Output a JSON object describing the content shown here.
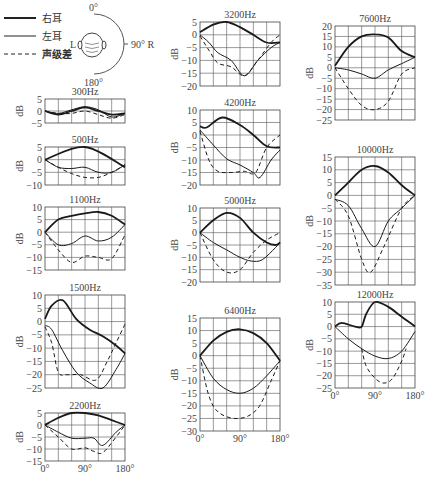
{
  "legend": {
    "items": [
      {
        "label": "右耳",
        "style": "solid-thick"
      },
      {
        "label": "左耳",
        "style": "solid-thin"
      },
      {
        "label": "声级差",
        "style": "dashed"
      }
    ],
    "head_diagram": {
      "top": "0°",
      "bottom": "180°",
      "right": "90° R",
      "left": "L"
    }
  },
  "chart_data": [
    {
      "type": "line",
      "title": "300Hz",
      "ylabel": "dB",
      "xlabel": "",
      "xlim": [
        0,
        180
      ],
      "ylim": [
        -5,
        5
      ],
      "yticks": [
        5,
        0,
        -5
      ],
      "xticks": [],
      "grid": true,
      "series": [
        {
          "name": "右耳",
          "x": [
            0,
            30,
            60,
            90,
            120,
            150,
            180
          ],
          "y": [
            0,
            -1.5,
            0,
            1.5,
            0,
            -1.5,
            -1
          ]
        },
        {
          "name": "左耳",
          "x": [
            0,
            30,
            60,
            90,
            120,
            150,
            180
          ],
          "y": [
            0,
            -1,
            0.5,
            1.8,
            0.5,
            -2.5,
            -1
          ]
        },
        {
          "name": "声级差",
          "x": [
            0,
            30,
            60,
            90,
            120,
            150,
            180
          ],
          "y": [
            0,
            -1,
            -1,
            0,
            -1.5,
            -3,
            -1.5
          ]
        }
      ]
    },
    {
      "type": "line",
      "title": "500Hz",
      "ylabel": "dB",
      "xlabel": "",
      "xlim": [
        0,
        180
      ],
      "ylim": [
        -10,
        5
      ],
      "yticks": [
        5,
        0,
        -5,
        -10
      ],
      "xticks": [],
      "grid": true,
      "series": [
        {
          "name": "右耳",
          "x": [
            0,
            90,
            180
          ],
          "y": [
            0,
            5,
            -3
          ]
        },
        {
          "name": "左耳",
          "x": [
            0,
            30,
            60,
            90,
            120,
            150,
            180
          ],
          "y": [
            0,
            -3,
            -3.5,
            -3,
            -5,
            -5,
            -2
          ]
        },
        {
          "name": "声级差",
          "x": [
            0,
            30,
            60,
            90,
            120,
            150,
            180
          ],
          "y": [
            0,
            -3,
            -5.5,
            -7,
            -7,
            -5,
            -2
          ]
        }
      ]
    },
    {
      "type": "line",
      "title": "1100Hz",
      "ylabel": "dB",
      "xlabel": "",
      "xlim": [
        0,
        180
      ],
      "ylim": [
        -15,
        10
      ],
      "yticks": [
        10,
        5,
        0,
        -5,
        -10,
        -15
      ],
      "xticks": [],
      "grid": true,
      "series": [
        {
          "name": "右耳",
          "x": [
            0,
            30,
            60,
            90,
            120,
            150,
            180
          ],
          "y": [
            0,
            5,
            6.5,
            7.5,
            8,
            6.5,
            3
          ]
        },
        {
          "name": "左耳",
          "x": [
            0,
            30,
            60,
            90,
            120,
            150,
            180
          ],
          "y": [
            0,
            -5,
            -4.5,
            -1.5,
            -3.5,
            -2,
            3
          ]
        },
        {
          "name": "声级差",
          "x": [
            0,
            30,
            60,
            90,
            120,
            150,
            180
          ],
          "y": [
            0,
            -7,
            -12,
            -9.5,
            -10,
            -10.5,
            -1
          ]
        }
      ]
    },
    {
      "type": "line",
      "title": "1500Hz",
      "ylabel": "dB",
      "xlabel": "",
      "xlim": [
        0,
        180
      ],
      "ylim": [
        -25,
        10
      ],
      "yticks": [
        10,
        5,
        0,
        -5,
        -10,
        -15,
        -20,
        -25
      ],
      "xticks": [],
      "grid": true,
      "series": [
        {
          "name": "右耳",
          "x": [
            0,
            15,
            40,
            70,
            100,
            130,
            160,
            180
          ],
          "y": [
            1,
            6,
            8,
            1,
            -3,
            -5.5,
            -9,
            -12
          ]
        },
        {
          "name": "左耳",
          "x": [
            0,
            15,
            40,
            70,
            100,
            130,
            160,
            180
          ],
          "y": [
            -1.5,
            -3,
            -11,
            -19,
            -23,
            -25,
            -18,
            -12
          ]
        },
        {
          "name": "声级差",
          "x": [
            0,
            15,
            30,
            50,
            80,
            115,
            140,
            160,
            180
          ],
          "y": [
            -2,
            -8,
            -19,
            -20,
            -20,
            -22,
            -15,
            -8,
            -1
          ]
        }
      ]
    },
    {
      "type": "line",
      "title": "2200Hz",
      "ylabel": "dB",
      "xlabel": "",
      "xlim": [
        0,
        180
      ],
      "ylim": [
        -15,
        5
      ],
      "yticks": [
        5,
        0,
        -5,
        -10,
        -15
      ],
      "xticks": [
        "0°",
        "90°",
        "180°"
      ],
      "grid": true,
      "series": [
        {
          "name": "右耳",
          "x": [
            0,
            30,
            60,
            90,
            120,
            150,
            180
          ],
          "y": [
            0,
            3,
            5,
            5,
            4,
            2,
            0
          ]
        },
        {
          "name": "左耳",
          "x": [
            0,
            30,
            60,
            90,
            110,
            130,
            160,
            180
          ],
          "y": [
            0,
            -3,
            -5.5,
            -5.5,
            -5.5,
            -8.5,
            -3,
            0
          ]
        },
        {
          "name": "声级差",
          "x": [
            0,
            30,
            60,
            90,
            110,
            130,
            160,
            180
          ],
          "y": [
            0,
            -5,
            -10,
            -9.5,
            -11,
            -11.5,
            -5,
            0
          ]
        }
      ]
    },
    {
      "type": "line",
      "title": "3200Hz",
      "ylabel": "dB",
      "xlabel": "",
      "xlim": [
        0,
        180
      ],
      "ylim": [
        -20,
        5
      ],
      "yticks": [
        5,
        0,
        -5,
        -10,
        -15,
        -20
      ],
      "xticks": [],
      "grid": true,
      "series": [
        {
          "name": "右耳",
          "x": [
            0,
            30,
            60,
            90,
            120,
            150,
            180
          ],
          "y": [
            1,
            4,
            5,
            3,
            0,
            -3,
            -3
          ]
        },
        {
          "name": "左耳",
          "x": [
            0,
            20,
            40,
            70,
            100,
            130,
            160,
            180
          ],
          "y": [
            0,
            -3,
            -7,
            -10,
            -16,
            -10,
            -5,
            -3
          ]
        },
        {
          "name": "声级差",
          "x": [
            0,
            20,
            40,
            70,
            100,
            130,
            160,
            180
          ],
          "y": [
            -0.5,
            -6,
            -11,
            -12.5,
            -16,
            -10,
            -3,
            0
          ]
        }
      ]
    },
    {
      "type": "line",
      "title": "4200Hz",
      "ylabel": "dB",
      "xlabel": "",
      "xlim": [
        0,
        180
      ],
      "ylim": [
        -20,
        10
      ],
      "yticks": [
        10,
        5,
        0,
        -5,
        -10,
        -15,
        -20
      ],
      "xticks": [],
      "grid": true,
      "series": [
        {
          "name": "右耳",
          "x": [
            0,
            15,
            50,
            90,
            120,
            150,
            180
          ],
          "y": [
            3.5,
            3,
            7,
            4,
            0,
            -4.5,
            -5
          ]
        },
        {
          "name": "左耳",
          "x": [
            0,
            30,
            60,
            90,
            120,
            135,
            160,
            180
          ],
          "y": [
            2,
            -4,
            -9.5,
            -12,
            -15,
            -17,
            -10,
            -6
          ]
        },
        {
          "name": "声级差",
          "x": [
            0,
            20,
            40,
            70,
            100,
            125,
            150,
            180
          ],
          "y": [
            1.5,
            -10,
            -14.5,
            -15,
            -14.5,
            -15,
            -5,
            0
          ]
        }
      ]
    },
    {
      "type": "line",
      "title": "5000Hz",
      "ylabel": "dB",
      "xlabel": "",
      "xlim": [
        0,
        180
      ],
      "ylim": [
        -20,
        10
      ],
      "yticks": [
        10,
        5,
        0,
        -5,
        -10,
        -15,
        -20
      ],
      "xticks": [],
      "grid": true,
      "series": [
        {
          "name": "右耳",
          "x": [
            0,
            30,
            60,
            90,
            120,
            150,
            170,
            180
          ],
          "y": [
            0,
            5,
            8,
            6,
            0,
            -4,
            -5,
            -4
          ]
        },
        {
          "name": "左耳",
          "x": [
            0,
            30,
            60,
            90,
            115,
            140,
            170,
            180
          ],
          "y": [
            0,
            -4,
            -7,
            -10,
            -11.5,
            -11,
            -6,
            -4
          ]
        },
        {
          "name": "声级差",
          "x": [
            0,
            30,
            60,
            90,
            120,
            150,
            180
          ],
          "y": [
            0,
            -11,
            -16,
            -15,
            -8,
            -3,
            0
          ]
        }
      ]
    },
    {
      "type": "line",
      "title": "6400Hz",
      "ylabel": "dB",
      "xlabel": "",
      "xlim": [
        0,
        180
      ],
      "ylim": [
        -30,
        15
      ],
      "yticks": [
        15,
        10,
        5,
        0,
        -5,
        -10,
        -15,
        -20,
        -25,
        -30
      ],
      "xticks": [
        "0°",
        "90°",
        "180°"
      ],
      "grid": true,
      "series": [
        {
          "name": "右耳",
          "x": [
            0,
            30,
            60,
            90,
            120,
            150,
            180
          ],
          "y": [
            0,
            6,
            9.5,
            10.5,
            9,
            5,
            -2
          ]
        },
        {
          "name": "左耳",
          "x": [
            0,
            30,
            60,
            90,
            120,
            150,
            180
          ],
          "y": [
            0,
            -9,
            -13.5,
            -15,
            -13,
            -8,
            -2
          ]
        },
        {
          "name": "声级差",
          "x": [
            0,
            20,
            45,
            90,
            130,
            160,
            180
          ],
          "y": [
            0,
            -16,
            -23,
            -25,
            -21,
            -10,
            -2
          ]
        }
      ]
    },
    {
      "type": "line",
      "title": "7600Hz",
      "ylabel": "dB",
      "xlabel": "",
      "xlim": [
        0,
        180
      ],
      "ylim": [
        -25,
        20
      ],
      "yticks": [
        20,
        15,
        10,
        5,
        0,
        -5,
        -10,
        -15,
        -20,
        -25
      ],
      "xticks": [],
      "grid": true,
      "series": [
        {
          "name": "右耳",
          "x": [
            0,
            30,
            60,
            90,
            120,
            150,
            180
          ],
          "y": [
            1,
            10,
            15,
            16,
            14.5,
            8,
            5
          ]
        },
        {
          "name": "左耳",
          "x": [
            0,
            30,
            60,
            90,
            120,
            150,
            180
          ],
          "y": [
            0,
            -1,
            -3,
            -5,
            -1,
            2,
            5
          ]
        },
        {
          "name": "声级差",
          "x": [
            0,
            30,
            60,
            90,
            120,
            150,
            180
          ],
          "y": [
            0,
            -10,
            -18,
            -20,
            -16,
            -3,
            0
          ]
        }
      ]
    },
    {
      "type": "line",
      "title": "10000Hz",
      "ylabel": "dB",
      "xlabel": "",
      "xlim": [
        0,
        180
      ],
      "ylim": [
        -35,
        15
      ],
      "yticks": [
        15,
        10,
        5,
        0,
        -5,
        -10,
        -15,
        -20,
        -25,
        -30,
        -35
      ],
      "xticks": [],
      "grid": true,
      "series": [
        {
          "name": "右耳",
          "x": [
            0,
            30,
            60,
            90,
            120,
            150,
            180
          ],
          "y": [
            0,
            5,
            10,
            11.5,
            9,
            4,
            0
          ]
        },
        {
          "name": "左耳",
          "x": [
            0,
            30,
            60,
            90,
            120,
            150,
            180
          ],
          "y": [
            -1.5,
            -4,
            -13,
            -20,
            -10,
            -5,
            0
          ]
        },
        {
          "name": "声级差",
          "x": [
            0,
            30,
            60,
            80,
            110,
            150,
            180
          ],
          "y": [
            -1.5,
            -8,
            -25,
            -30,
            -20,
            -5,
            0
          ]
        }
      ]
    },
    {
      "type": "line",
      "title": "12000Hz",
      "ylabel": "dB",
      "xlabel": "",
      "xlim": [
        0,
        180
      ],
      "ylim": [
        -25,
        10
      ],
      "yticks": [
        10,
        5,
        0,
        -5,
        -10,
        -15,
        -20,
        -25
      ],
      "xticks": [
        "0°",
        "90°",
        "180°"
      ],
      "grid": true,
      "series": [
        {
          "name": "右耳",
          "x": [
            0,
            15,
            45,
            60,
            70,
            90,
            120,
            150,
            180
          ],
          "y": [
            0,
            1.5,
            0,
            0,
            5,
            10,
            8,
            4,
            0
          ]
        },
        {
          "name": "左耳",
          "x": [
            0,
            30,
            60,
            90,
            120,
            150,
            180
          ],
          "y": [
            0,
            -5,
            -9,
            -12,
            -13,
            -10,
            -2
          ]
        },
        {
          "name": "声级差",
          "x": [
            60,
            70,
            90,
            110,
            130,
            150,
            160
          ],
          "y": [
            -9,
            -16,
            -21,
            -23,
            -21,
            -14,
            -9
          ]
        }
      ]
    }
  ]
}
